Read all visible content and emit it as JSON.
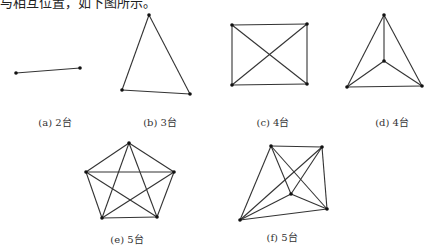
{
  "header": {
    "text": "与相互位置，如下图所示。"
  },
  "style": {
    "line_color": "#333333",
    "dot_color": "#111111"
  },
  "figures": [
    {
      "id": "a",
      "label": "(a) 2台",
      "label_pos": [
        55,
        114
      ],
      "nodes": [
        [
          16,
          73
        ],
        [
          80,
          68
        ]
      ],
      "edges": [
        [
          0,
          1
        ]
      ]
    },
    {
      "id": "b",
      "label": "(b) 3台",
      "label_pos": [
        160,
        114
      ],
      "nodes": [
        [
          149,
          15
        ],
        [
          122,
          90
        ],
        [
          190,
          94
        ]
      ],
      "edges": [
        [
          0,
          1
        ],
        [
          1,
          2
        ],
        [
          2,
          0
        ]
      ]
    },
    {
      "id": "c",
      "label": "(c) 4台",
      "label_pos": [
        273,
        114
      ],
      "nodes": [
        [
          232,
          25
        ],
        [
          307,
          24
        ],
        [
          307,
          84
        ],
        [
          232,
          85
        ]
      ],
      "edges": [
        [
          0,
          1
        ],
        [
          1,
          2
        ],
        [
          2,
          3
        ],
        [
          3,
          0
        ],
        [
          0,
          2
        ],
        [
          1,
          3
        ]
      ]
    },
    {
      "id": "d",
      "label": "(d) 4台",
      "label_pos": [
        392,
        114
      ],
      "nodes": [
        [
          384,
          15
        ],
        [
          384,
          61
        ],
        [
          347,
          87
        ],
        [
          422,
          86
        ]
      ],
      "edges": [
        [
          0,
          2
        ],
        [
          2,
          3
        ],
        [
          3,
          0
        ],
        [
          0,
          1
        ],
        [
          1,
          2
        ],
        [
          1,
          3
        ]
      ]
    },
    {
      "id": "e",
      "label": "(e) 5台",
      "label_pos": [
        127,
        231
      ],
      "nodes": [
        [
          129,
          143
        ],
        [
          174,
          172
        ],
        [
          157,
          217
        ],
        [
          102,
          218
        ],
        [
          86,
          172
        ]
      ],
      "edges": [
        [
          0,
          1
        ],
        [
          1,
          2
        ],
        [
          2,
          3
        ],
        [
          3,
          4
        ],
        [
          4,
          0
        ],
        [
          0,
          2
        ],
        [
          0,
          3
        ],
        [
          1,
          3
        ],
        [
          1,
          4
        ],
        [
          2,
          4
        ]
      ]
    },
    {
      "id": "f",
      "label": "(f) 5台",
      "label_pos": [
        282,
        229
      ],
      "nodes": [
        [
          271,
          146
        ],
        [
          322,
          147
        ],
        [
          327,
          209
        ],
        [
          240,
          220
        ],
        [
          291,
          194
        ]
      ],
      "edges": [
        [
          0,
          1
        ],
        [
          1,
          2
        ],
        [
          2,
          3
        ],
        [
          3,
          0
        ],
        [
          0,
          2
        ],
        [
          1,
          3
        ],
        [
          0,
          4
        ],
        [
          1,
          4
        ],
        [
          2,
          4
        ],
        [
          3,
          4
        ]
      ]
    }
  ]
}
